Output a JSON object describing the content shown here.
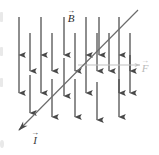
{
  "figure": {
    "background_color": "#ffffff",
    "width": 159,
    "height": 155
  },
  "labels": {
    "magnetic_field": {
      "symbol": "B",
      "accent": "→",
      "color": "#2a2a2a"
    },
    "force": {
      "symbol": "F",
      "accent": "→",
      "color": "#b9b9b9"
    },
    "current": {
      "symbol": "I",
      "accent": "→",
      "color": "#3a3a3a"
    }
  },
  "field_arrows": {
    "color": "#4a4a4a",
    "direction": "down",
    "count": 22,
    "length_long": 38,
    "length_short": 30,
    "rows": [
      {
        "y_top": 17,
        "y_tip": 55,
        "x_positions": [
          19,
          41,
          64,
          86,
          99,
          119
        ]
      },
      {
        "y_top": 33,
        "y_tip": 71,
        "x_positions": [
          30,
          52,
          75,
          97,
          109,
          130
        ]
      },
      {
        "y_top": 55,
        "y_tip": 93,
        "x_positions": [
          19,
          41,
          52,
          64,
          86,
          97,
          119,
          130
        ]
      },
      {
        "y_top": 75,
        "y_tip": 113,
        "x_positions": [
          30,
          52,
          75,
          86,
          97,
          119
        ]
      }
    ]
  },
  "current_line": {
    "color": "#6b6b6b",
    "x1": 138,
    "y1": 10,
    "x2": 17,
    "y2": 132,
    "arrowhead_at": "bottom-left"
  },
  "force_line": {
    "color": "#c2c2c2",
    "x1": 78,
    "y1": 65,
    "x2": 140,
    "y2": 65,
    "arrowhead_at": "right"
  }
}
